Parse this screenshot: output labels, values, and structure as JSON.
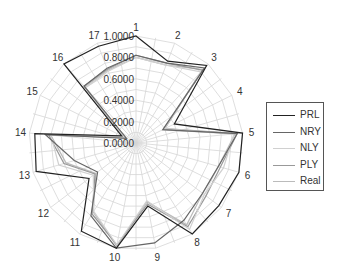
{
  "chart_data": {
    "type": "radar",
    "title": "",
    "categories": [
      "1",
      "2",
      "3",
      "4",
      "5",
      "6",
      "7",
      "8",
      "9",
      "10",
      "11",
      "12",
      "13",
      "14",
      "15",
      "16",
      "17"
    ],
    "ring_labels": [
      "0.0000",
      "0.2000",
      "0.4000",
      "0.6000",
      "0.8000",
      "1.0000"
    ],
    "rlim": [
      0,
      1
    ],
    "grid": true,
    "legend_position": "right",
    "series": [
      {
        "name": "PRL",
        "color": "#222222",
        "values": [
          1.0,
          0.82,
          0.98,
          0.4,
          1.0,
          1.0,
          0.97,
          1.0,
          0.6,
          1.0,
          0.97,
          0.55,
          0.97,
          0.95,
          0.15,
          1.0,
          0.97
        ]
      },
      {
        "name": "NRY",
        "color": "#666666",
        "values": [
          0.82,
          0.8,
          0.95,
          0.28,
          0.95,
          0.8,
          0.78,
          0.85,
          0.95,
          1.0,
          0.8,
          0.45,
          0.6,
          0.85,
          0.1,
          0.72,
          0.75
        ]
      },
      {
        "name": "NLY",
        "color": "#d0d0d0",
        "values": [
          0.8,
          0.78,
          0.9,
          0.3,
          0.92,
          0.85,
          0.8,
          0.95,
          0.55,
          0.97,
          0.75,
          0.5,
          0.75,
          0.8,
          0.12,
          0.7,
          0.72
        ]
      },
      {
        "name": "PLY",
        "color": "#999999",
        "values": [
          0.82,
          0.8,
          0.92,
          0.3,
          0.95,
          0.82,
          0.82,
          0.92,
          0.58,
          0.97,
          0.78,
          0.48,
          0.7,
          0.82,
          0.12,
          0.72,
          0.74
        ]
      },
      {
        "name": "Real",
        "color": "#bbbbbb",
        "values": [
          0.8,
          0.78,
          0.93,
          0.28,
          0.93,
          0.8,
          0.78,
          0.9,
          0.56,
          0.98,
          0.76,
          0.47,
          0.68,
          0.8,
          0.11,
          0.71,
          0.73
        ]
      }
    ]
  }
}
